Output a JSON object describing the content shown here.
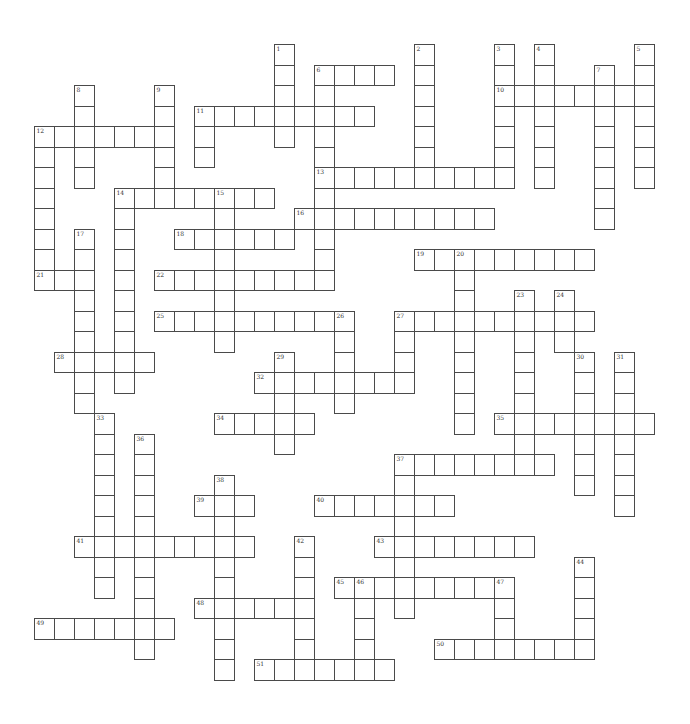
{
  "puzzle": {
    "type": "crossword",
    "grid": {
      "origin_x": 33.5,
      "origin_y": 44,
      "cell_w": 20,
      "cell_h": 20.5
    },
    "colors": {
      "border": "#4a4a4a",
      "cell_fill": "#ffffff",
      "number": "#333333"
    },
    "across": [
      {
        "num": "6",
        "row": 1,
        "col": 14,
        "len": 4
      },
      {
        "num": "10",
        "row": 2,
        "col": 23,
        "len": 8
      },
      {
        "num": "11",
        "row": 3,
        "col": 8,
        "len": 9
      },
      {
        "num": "12",
        "row": 4,
        "col": 0,
        "len": 7
      },
      {
        "num": "13",
        "row": 6,
        "col": 14,
        "len": 10
      },
      {
        "num": "14",
        "row": 7,
        "col": 4,
        "len": 8
      },
      {
        "num": "16",
        "row": 8,
        "col": 13,
        "len": 10
      },
      {
        "num": "18",
        "row": 9,
        "col": 7,
        "len": 6
      },
      {
        "num": "19",
        "row": 10,
        "col": 19,
        "len": 9
      },
      {
        "num": "21",
        "row": 11,
        "col": 0,
        "len": 3
      },
      {
        "num": "22",
        "row": 11,
        "col": 6,
        "len": 9
      },
      {
        "num": "25",
        "row": 13,
        "col": 6,
        "len": 10
      },
      {
        "num": "27",
        "row": 13,
        "col": 18,
        "len": 10
      },
      {
        "num": "28",
        "row": 15,
        "col": 1,
        "len": 5
      },
      {
        "num": "32",
        "row": 16,
        "col": 11,
        "len": 8
      },
      {
        "num": "34",
        "row": 18,
        "col": 9,
        "len": 5
      },
      {
        "num": "35",
        "row": 18,
        "col": 23,
        "len": 8
      },
      {
        "num": "37",
        "row": 20,
        "col": 18,
        "len": 8
      },
      {
        "num": "39",
        "row": 22,
        "col": 8,
        "len": 3
      },
      {
        "num": "40",
        "row": 22,
        "col": 14,
        "len": 7
      },
      {
        "num": "41",
        "row": 24,
        "col": 2,
        "len": 9
      },
      {
        "num": "43",
        "row": 24,
        "col": 17,
        "len": 8
      },
      {
        "num": "45",
        "row": 26,
        "col": 15,
        "len": 9
      },
      {
        "num": "48",
        "row": 27,
        "col": 8,
        "len": 6
      },
      {
        "num": "49",
        "row": 28,
        "col": 0,
        "len": 7
      },
      {
        "num": "50",
        "row": 29,
        "col": 20,
        "len": 8
      },
      {
        "num": "51",
        "row": 30,
        "col": 11,
        "len": 7
      }
    ],
    "down": [
      {
        "num": "1",
        "row": 0,
        "col": 12,
        "len": 5
      },
      {
        "num": "2",
        "row": 0,
        "col": 19,
        "len": 7
      },
      {
        "num": "3",
        "row": 0,
        "col": 23,
        "len": 7
      },
      {
        "num": "4",
        "row": 0,
        "col": 25,
        "len": 7
      },
      {
        "num": "5",
        "row": 0,
        "col": 30,
        "len": 7
      },
      {
        "num": "6",
        "row": 1,
        "col": 14,
        "len": 11
      },
      {
        "num": "7",
        "row": 1,
        "col": 28,
        "len": 8
      },
      {
        "num": "8",
        "row": 2,
        "col": 2,
        "len": 5
      },
      {
        "num": "9",
        "row": 2,
        "col": 6,
        "len": 6
      },
      {
        "num": "11",
        "row": 3,
        "col": 8,
        "len": 3
      },
      {
        "num": "12",
        "row": 4,
        "col": 0,
        "len": 8
      },
      {
        "num": "14",
        "row": 7,
        "col": 4,
        "len": 10
      },
      {
        "num": "15",
        "row": 7,
        "col": 9,
        "len": 8
      },
      {
        "num": "17",
        "row": 9,
        "col": 2,
        "len": 9
      },
      {
        "num": "20",
        "row": 10,
        "col": 21,
        "len": 9
      },
      {
        "num": "23",
        "row": 12,
        "col": 24,
        "len": 9
      },
      {
        "num": "24",
        "row": 12,
        "col": 26,
        "len": 3
      },
      {
        "num": "26",
        "row": 13,
        "col": 15,
        "len": 5
      },
      {
        "num": "27",
        "row": 13,
        "col": 18,
        "len": 4
      },
      {
        "num": "29",
        "row": 15,
        "col": 12,
        "len": 5
      },
      {
        "num": "30",
        "row": 15,
        "col": 27,
        "len": 7
      },
      {
        "num": "31",
        "row": 15,
        "col": 29,
        "len": 8
      },
      {
        "num": "33",
        "row": 18,
        "col": 3,
        "len": 9
      },
      {
        "num": "36",
        "row": 19,
        "col": 5,
        "len": 11
      },
      {
        "num": "37",
        "row": 20,
        "col": 18,
        "len": 8
      },
      {
        "num": "38",
        "row": 21,
        "col": 9,
        "len": 10
      },
      {
        "num": "42",
        "row": 24,
        "col": 13,
        "len": 7
      },
      {
        "num": "44",
        "row": 25,
        "col": 27,
        "len": 5
      },
      {
        "num": "46",
        "row": 26,
        "col": 16,
        "len": 5
      },
      {
        "num": "47",
        "row": 26,
        "col": 23,
        "len": 4
      }
    ]
  }
}
